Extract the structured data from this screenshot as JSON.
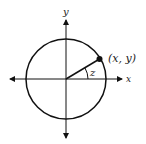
{
  "diagram": {
    "type": "unit-circle",
    "labels": {
      "y_axis": "y",
      "x_axis": "x",
      "point": "(x, y)",
      "angle": "z"
    },
    "colors": {
      "stroke": "#111111",
      "background": "#ffffff"
    }
  }
}
